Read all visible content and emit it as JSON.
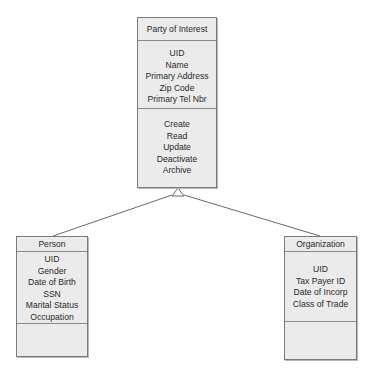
{
  "diagram": {
    "type": "uml-class-inheritance",
    "colors": {
      "box_fill": "#ebebeb",
      "box_border": "#7a7a7a",
      "line": "#6a6a6a",
      "text": "#2a2a2a"
    },
    "parent": {
      "name": "Party of Interest",
      "attributes": [
        "UID",
        "Name",
        "Primary Address",
        "Zip Code",
        "Primary Tel Nbr"
      ],
      "operations": [
        "Create",
        "Read",
        "Update",
        "Deactivate",
        "Archive"
      ]
    },
    "children": [
      {
        "name": "Person",
        "attributes": [
          "UID",
          "Gender",
          "Date of Birth",
          "SSN",
          "Marital Status",
          "Occupation"
        ],
        "operations": []
      },
      {
        "name": "Organization",
        "attributes": [
          "UID",
          "Tax Payer ID",
          "Date of Incorp",
          "Class of Trade"
        ],
        "operations": []
      }
    ],
    "relationships": [
      {
        "from": "Person",
        "to": "Party of Interest",
        "type": "generalization"
      },
      {
        "from": "Organization",
        "to": "Party of Interest",
        "type": "generalization"
      }
    ]
  }
}
